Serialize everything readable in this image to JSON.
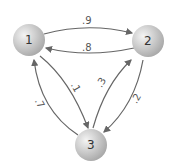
{
  "diagram": {
    "type": "markov-chain",
    "nodes": [
      {
        "id": "1",
        "label": "1"
      },
      {
        "id": "2",
        "label": "2"
      },
      {
        "id": "3",
        "label": "3"
      }
    ],
    "edges": [
      {
        "from": "1",
        "to": "2",
        "label": ".9"
      },
      {
        "from": "2",
        "to": "1",
        "label": ".8"
      },
      {
        "from": "1",
        "to": "3",
        "label": ".1"
      },
      {
        "from": "3",
        "to": "1",
        "label": ".7"
      },
      {
        "from": "3",
        "to": "2",
        "label": ".3"
      },
      {
        "from": "2",
        "to": "3",
        "label": ".2"
      }
    ]
  },
  "colors": {
    "edge": "#666666",
    "node_light": "#f2f2f2",
    "node_dark": "#a8a8a8"
  }
}
